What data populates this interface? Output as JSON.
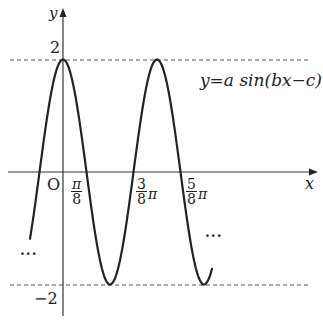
{
  "header": {
    "cropped_text": ""
  },
  "axes": {
    "x_label": "x",
    "y_label": "y",
    "origin_label": "O"
  },
  "labels": {
    "y_max": "2",
    "y_min": "−2",
    "equation": "y=a sin(bx−c)",
    "ellipsis_left": "···",
    "ellipsis_right": "···",
    "tick_pi_over_8": {
      "num": "π",
      "den": "8"
    },
    "tick_3pi_over_8": {
      "num": "3",
      "den": "8",
      "suffix": "π"
    },
    "tick_5pi_over_8": {
      "num": "5",
      "den": "8",
      "suffix": "π"
    }
  },
  "chart_data": {
    "type": "line",
    "title": "",
    "equation_label": "y = a sin(bx − c)",
    "xlabel": "x",
    "ylabel": "y",
    "x_ticks": [
      "O",
      "π/8",
      "3π/8",
      "5π/8"
    ],
    "y_ticks": [
      "2",
      "−2"
    ],
    "dashed_lines": [
      2,
      -2
    ],
    "amplitude": 2,
    "period": "π/2",
    "key_points": [
      {
        "x": "0",
        "y": 2,
        "type": "max"
      },
      {
        "x": "π/8",
        "y": 0,
        "type": "zero"
      },
      {
        "x": "π/4",
        "y": -2,
        "type": "min"
      },
      {
        "x": "3π/8",
        "y": 0,
        "type": "zero"
      },
      {
        "x": "π/2",
        "y": 2,
        "type": "max"
      },
      {
        "x": "5π/8",
        "y": 0,
        "type": "zero"
      },
      {
        "x": "3π/4",
        "y": -2,
        "type": "min"
      }
    ],
    "grid": false,
    "legend": null
  },
  "colors": {
    "curve": "#222222",
    "axis": "#333333",
    "dashed": "#555555"
  }
}
